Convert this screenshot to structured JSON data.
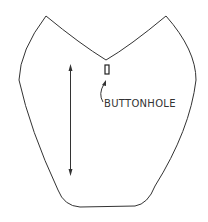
{
  "diagram": {
    "type": "sewing-pattern-piece",
    "labels": {
      "buttonhole": "BUTTONHOLE"
    },
    "elements": [
      "pattern-outline",
      "grainline-arrow",
      "buttonhole-mark",
      "buttonhole-pointer"
    ],
    "colors": {
      "line": "#333333",
      "background": "#ffffff"
    }
  }
}
